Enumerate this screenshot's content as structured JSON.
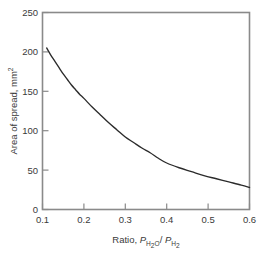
{
  "figure": {
    "background": "#ffffff",
    "frame_color": "#8a8a8a",
    "curve_color": "#2b2b2b",
    "text_color": "#3a3a3a"
  },
  "axes": {
    "y_title_main": "Area of spread, mm",
    "y_title_exponent": "2",
    "x_title_prefix": "Ratio, ",
    "x_title_p1": "P",
    "x_title_p1_sub": "H",
    "x_title_p1_sub2": "2",
    "x_title_p1_subO": "O",
    "x_title_slash": "/ ",
    "x_title_p2": "P",
    "x_title_p2_sub": "H",
    "x_title_p2_sub2": "2",
    "x_ticks": [
      "0.1",
      "0.2",
      "0.3",
      "0.4",
      "0.5",
      "0.6"
    ],
    "y_ticks": [
      "0",
      "50",
      "100",
      "150",
      "200",
      "250"
    ]
  },
  "chart_data": {
    "type": "line",
    "title": "",
    "xlabel": "Ratio, P_H2O / P_H2",
    "ylabel": "Area of spread, mm^2",
    "xlim": [
      0.1,
      0.6
    ],
    "ylim": [
      0,
      250
    ],
    "xticks": [
      0.1,
      0.2,
      0.3,
      0.4,
      0.5,
      0.6
    ],
    "yticks": [
      0,
      50,
      100,
      150,
      200,
      250
    ],
    "grid": false,
    "legend": null,
    "series": [
      {
        "name": "Area of spread",
        "x": [
          0.11,
          0.12,
          0.13,
          0.14,
          0.15,
          0.16,
          0.17,
          0.18,
          0.19,
          0.2,
          0.22,
          0.24,
          0.26,
          0.28,
          0.3,
          0.32,
          0.34,
          0.36,
          0.38,
          0.4,
          0.43,
          0.46,
          0.49,
          0.52,
          0.55,
          0.58,
          0.6
        ],
        "y": [
          205,
          196,
          188,
          180,
          172,
          165,
          158,
          152,
          146,
          141,
          130,
          120,
          110,
          101,
          92,
          85,
          78,
          72,
          65,
          59,
          53,
          48,
          43,
          39,
          35,
          31,
          28
        ]
      }
    ]
  }
}
